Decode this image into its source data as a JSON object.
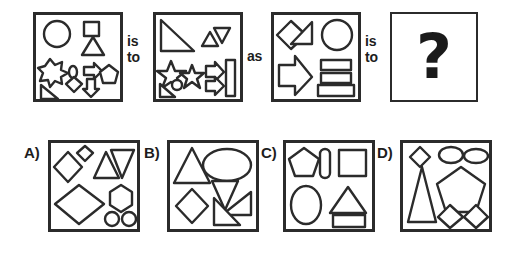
{
  "puzzle": {
    "type": "visual-analogy",
    "prompt_connectors": [
      {
        "id": "conn-1",
        "lines": [
          "is",
          "to"
        ]
      },
      {
        "id": "conn-2",
        "lines": [
          "as"
        ]
      },
      {
        "id": "conn-3",
        "lines": [
          "is",
          "to"
        ]
      }
    ],
    "answer_placeholder": "?",
    "stroke_color": "#2b2b2b",
    "fill_color": "#ffffff",
    "background_color": "#ffffff"
  },
  "prompt_panels": [
    {
      "id": "panel-a",
      "name": "prompt-panel-1",
      "shapes": [
        "circle",
        "square",
        "triangle",
        "six-point-star",
        "small-oval",
        "right-arrow",
        "pentagon",
        "right-triangle",
        "diamond",
        "down-arrow"
      ],
      "shape_count": 10
    },
    {
      "id": "panel-b",
      "name": "prompt-panel-2",
      "shapes": [
        "large-right-triangle",
        "small-triangle",
        "small-inverted-triangle",
        "star",
        "star",
        "small-circle",
        "small-right-triangle",
        "right-arrow",
        "right-arrow",
        "vertical-bar"
      ],
      "shape_count": 10
    },
    {
      "id": "panel-c",
      "name": "prompt-panel-3",
      "shapes": [
        "diamond",
        "triangle",
        "circle",
        "large-right-arrow",
        "rectangle",
        "rectangle",
        "rectangle"
      ],
      "shape_count": 7
    },
    {
      "id": "panel-answer",
      "name": "answer-panel",
      "shapes": [
        "question-mark"
      ],
      "shape_count": 1
    }
  ],
  "options": [
    {
      "id": "option-a",
      "label": "A)",
      "shapes": [
        "diamond",
        "small-diamond",
        "triangle",
        "inverted-triangle",
        "large-diamond",
        "hexagon",
        "small-circle",
        "small-circle"
      ],
      "shape_count": 8
    },
    {
      "id": "option-b",
      "label": "B)",
      "shapes": [
        "triangle",
        "ellipse",
        "inverted-triangle",
        "diamond",
        "right-triangle",
        "right-triangle"
      ],
      "shape_count": 6
    },
    {
      "id": "option-c",
      "label": "C)",
      "shapes": [
        "pentagon",
        "small-vertical-oval",
        "square",
        "ellipse",
        "triangle",
        "rectangle"
      ],
      "shape_count": 6
    },
    {
      "id": "option-d",
      "label": "D)",
      "shapes": [
        "small-diamond",
        "small-ellipse",
        "small-ellipse",
        "tall-triangle",
        "pentagon",
        "diamond",
        "diamond"
      ],
      "shape_count": 7
    }
  ]
}
